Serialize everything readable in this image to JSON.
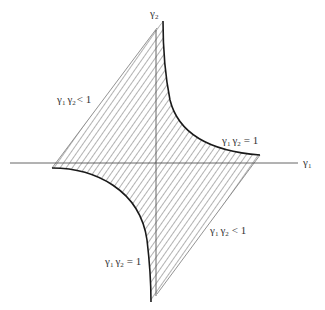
{
  "diagram": {
    "type": "region-plot",
    "axes": {
      "x_label": "γ",
      "x_label_sub": "1",
      "y_label": "γ",
      "y_label_sub": "2"
    },
    "labels": [
      {
        "id": "upper-left-inequality",
        "text_a": "γ",
        "sub_a": "1",
        "text_b": "γ",
        "sub_b": "2",
        "rel": "< 1"
      },
      {
        "id": "upper-right-curve",
        "text_a": "γ",
        "sub_a": "1",
        "text_b": "γ",
        "sub_b": "2",
        "rel": "= 1"
      },
      {
        "id": "lower-right-inequality",
        "text_a": "γ",
        "sub_a": "1",
        "text_b": "γ",
        "sub_b": "2",
        "rel": "< 1"
      },
      {
        "id": "lower-left-curve",
        "text_a": "γ",
        "sub_a": "1",
        "text_b": "γ",
        "sub_b": "2",
        "rel": "= 1"
      }
    ],
    "region": {
      "description": "Hatched region bounded by two hyperbola branches γ1γ2 = 1 and two straight edges",
      "hatch_color": "#555555",
      "boundary_color": "#222222"
    }
  }
}
